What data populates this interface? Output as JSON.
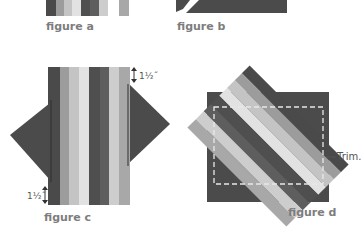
{
  "figures": {
    "a": {
      "caption": "figure a"
    },
    "b": {
      "caption": "figure b"
    },
    "c": {
      "caption": "figure c",
      "dim_top": "1½˝",
      "dim_bottom": "1½˝"
    },
    "d": {
      "caption": "figure d",
      "trim_label": "Trim."
    }
  },
  "strip_colors": [
    "#4a4a4a",
    "#9c9c9c",
    "#c4c4c4",
    "#e2e2e2",
    "#4f4f4f",
    "#5e5e5e",
    "#cdcdcd",
    "#a8a8a8"
  ],
  "colors": {
    "dark": "#4b4b4b",
    "caption": "#7d7d7d",
    "trim_line": "#e8e8e8"
  }
}
